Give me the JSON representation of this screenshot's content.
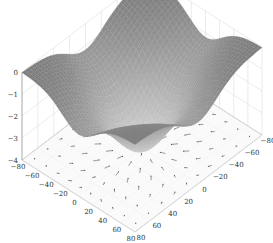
{
  "chart_data": {
    "type": "surface3d",
    "title": "",
    "xlabel": "",
    "ylabel": "",
    "zlabel": "",
    "x_ticks": [
      -80,
      -60,
      -40,
      -20,
      0,
      20,
      40,
      60,
      80
    ],
    "y_ticks": [
      -80,
      -60,
      -40,
      -20,
      0,
      20,
      40,
      60,
      80
    ],
    "z_ticks": [
      0,
      -1,
      -2,
      -3,
      -4
    ],
    "x_range": [
      -80,
      80
    ],
    "y_range": [
      -80,
      80
    ],
    "z_range": [
      -4,
      0
    ],
    "surface": {
      "function": "z = -4*exp(-(x^2+y^2)/(2*35^2)) * (1 - small ridges)",
      "min_z_at_center": -4,
      "max_z_at_corners": 0,
      "color": "#8a8a8a",
      "mesh_color": "#7a7a7a"
    },
    "quiver": {
      "plane_z": -4,
      "grid_step": 16,
      "arrow_color": "#555555",
      "direction": "radially toward center (gradient of surface)"
    },
    "grid": true,
    "grid_color": "#dddddd",
    "view": {
      "azimuth_deg": -45,
      "elevation_deg": 30
    }
  },
  "axes": {
    "z_labels": [
      "0",
      "−1",
      "−2",
      "−3",
      "−4"
    ],
    "x_labels": [
      "−80",
      "−60",
      "−40",
      "−20",
      "0",
      "20",
      "40",
      "60",
      "80"
    ],
    "y_labels": [
      "80",
      "60",
      "40",
      "20",
      "0",
      "−20",
      "−40",
      "−60",
      "−80"
    ]
  }
}
